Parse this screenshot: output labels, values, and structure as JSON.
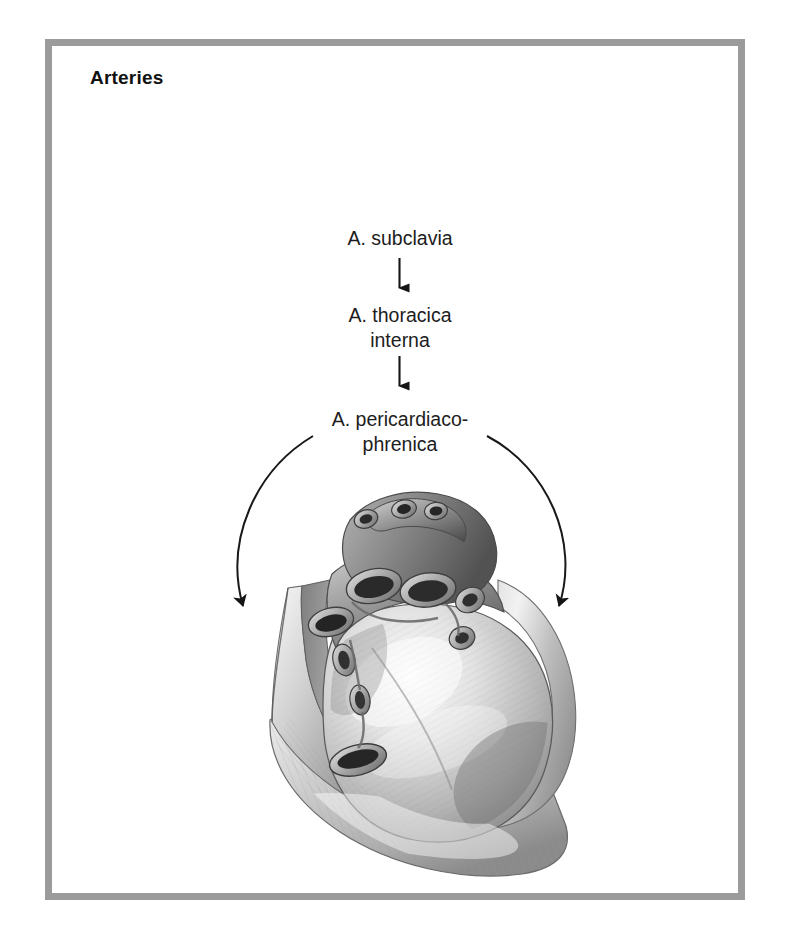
{
  "figure": {
    "title": "Arteries",
    "frame_color": "#9b9b9b",
    "background_color": "#ffffff",
    "text_color": "#1d1d1d"
  },
  "flow": {
    "nodes": [
      {
        "id": "subclavia",
        "label": "A. subclavia"
      },
      {
        "id": "thoracica-interna",
        "label": "A. thoracica\ninterna"
      },
      {
        "id": "pericardiacophrenica",
        "label": "A. pericardiaco-\nphrenica"
      }
    ],
    "connectors": [
      {
        "id": "arrow-subclavia-to-thoracica",
        "kind": "straight-down-arrow"
      },
      {
        "id": "arrow-thoracica-to-pericardiacophrenica",
        "kind": "straight-down-arrow"
      },
      {
        "id": "arrow-pericardiacophrenica-left",
        "kind": "curved-arrow-left"
      },
      {
        "id": "arrow-pericardiacophrenica-right",
        "kind": "curved-arrow-right"
      }
    ]
  },
  "illustration": {
    "name": "heart-in-opened-pericardial-sac",
    "description": "Grayscale anatomical drawing of the heart within the cut-open pericardial sac, viewed from the left anterior aspect",
    "tones": {
      "outline": "#3a3a3a",
      "shadow": "#5f5f5f",
      "midtone": "#8d8d8d",
      "light": "#c9c9c9",
      "highlight": "#efefef"
    }
  }
}
